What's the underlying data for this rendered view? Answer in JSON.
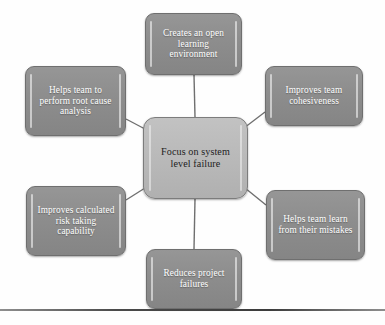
{
  "diagram": {
    "type": "hub-and-spoke",
    "colors": {
      "satellite_fill": "#8d8d8d",
      "satellite_text": "#ffffff",
      "center_fill": "#b9b9b9",
      "center_text": "#1d1d1d",
      "connector": "#6f6f6f",
      "rule": "#3c3c3c",
      "background": "#fefefe"
    },
    "center": {
      "id": "center",
      "label": "Focus on system level failure"
    },
    "nodes": [
      {
        "id": "top",
        "position": "top",
        "label": "Creates an open learning environment"
      },
      {
        "id": "top-right",
        "position": "top-right",
        "label": "Improves team cohesiveness"
      },
      {
        "id": "bottom-right",
        "position": "bottom-right",
        "label": "Helps team learn from their mistakes"
      },
      {
        "id": "bottom",
        "position": "bottom",
        "label": "Reduces project failures"
      },
      {
        "id": "bottom-left",
        "position": "bottom-left",
        "label": "Improves calculated risk taking capability"
      },
      {
        "id": "top-left",
        "position": "top-left",
        "label": "Helps team to perform root cause analysis"
      }
    ]
  }
}
